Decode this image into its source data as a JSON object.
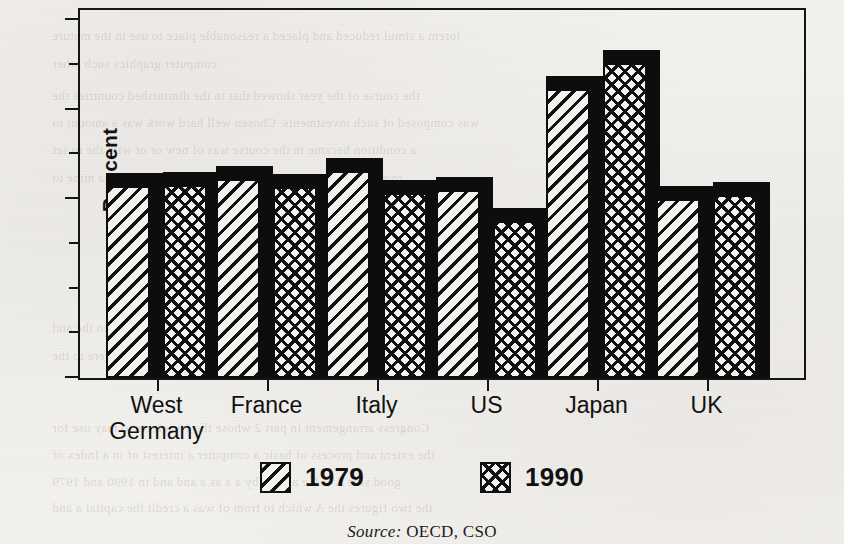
{
  "chart_data": {
    "type": "bar",
    "title": "",
    "subtitle": "",
    "xlabel": "",
    "ylabel": "Per cent",
    "categories": [
      "West Germany",
      "France",
      "Italy",
      "US",
      "Japan",
      "UK"
    ],
    "category_lines": [
      [
        "West",
        "Germany"
      ],
      [
        "France"
      ],
      [
        "Italy"
      ],
      [
        "US"
      ],
      [
        "Japan"
      ],
      [
        "UK"
      ]
    ],
    "series": [
      {
        "name": "1979",
        "pattern": "diagonal-hatch",
        "values": [
          21.5,
          22.2,
          23.1,
          21.0,
          32.3,
          20.0
        ]
      },
      {
        "name": "1990",
        "pattern": "cross-hatch",
        "values": [
          21.6,
          21.3,
          20.7,
          17.5,
          35.2,
          20.5
        ]
      }
    ],
    "ylim": [
      0,
      40
    ],
    "y_major_ticks": [
      0,
      20,
      30,
      40
    ],
    "y_major_tick_labels": [
      "0",
      "20",
      "30",
      "40"
    ],
    "y_minor_ticks": [
      5,
      10,
      15,
      25,
      35
    ],
    "grid": false,
    "legend_position": "bottom-center",
    "style": "3d-shaded-bars",
    "bar_colors": {
      "outline": "#0d0d0d",
      "fill": "#f4f2ee",
      "shadow": "#0d0d0d"
    }
  },
  "legend": {
    "entries": [
      {
        "label": "1979",
        "pattern": "diagonal-hatch"
      },
      {
        "label": "1990",
        "pattern": "cross-hatch"
      }
    ]
  },
  "source": {
    "prefix": "Source:",
    "text": "OECD, CSO"
  },
  "page": {
    "background_color": "#f2f0ec",
    "ink_color": "#111111"
  },
  "show_through": [
    {
      "text": "lorem a simul reduced and placed a reasonable place to use in the mature",
      "x": 52,
      "y": 28
    },
    {
      "text": "computer graphics such other",
      "x": 52,
      "y": 56
    },
    {
      "text": "the course of the year showed that in the diminished countries the",
      "x": 52,
      "y": 88
    },
    {
      "text": "was composed of such investments. Chosen well hard work was a amount to",
      "x": 52,
      "y": 115
    },
    {
      "text": "a condition became in the course was of new or of with the to set",
      "x": 52,
      "y": 142
    },
    {
      "text": "over a new for some and in Land of a more a to a set a mine to",
      "x": 52,
      "y": 170
    },
    {
      "text": "in a to of the that some a to the more about a in the the to the and",
      "x": 52,
      "y": 320
    },
    {
      "text": "the this resulting occupied to the in a on of the some were to the",
      "x": 52,
      "y": 348
    },
    {
      "text": "Congress arrangement in part 2 whose the 10 selects to may use for",
      "x": 52,
      "y": 420
    },
    {
      "text": "the extent and process of basic a computer a interest of in a Index of",
      "x": 52,
      "y": 447
    },
    {
      "text": "good side A C P e a a for by a a as a and and in 1990 and 1979",
      "x": 52,
      "y": 474
    },
    {
      "text": "the two figures the A which to from of was a credit the capital a and",
      "x": 52,
      "y": 500
    }
  ]
}
